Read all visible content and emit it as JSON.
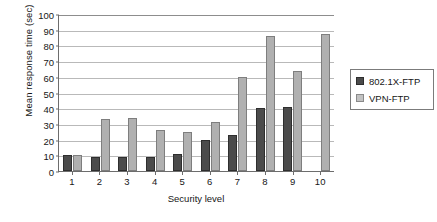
{
  "chart_data": {
    "type": "bar",
    "title": "",
    "xlabel": "Security level",
    "ylabel": "Mean response time (sec)",
    "categories": [
      "1",
      "2",
      "3",
      "4",
      "5",
      "6",
      "7",
      "8",
      "9",
      "10"
    ],
    "series": [
      {
        "name": "802.1X-FTP",
        "color": "#4b4b4b",
        "values": [
          10,
          9,
          9,
          9,
          11,
          20,
          23,
          40,
          41,
          0
        ]
      },
      {
        "name": "VPN-FTP",
        "color": "#b0b0b0",
        "values": [
          10,
          33,
          34,
          26,
          25,
          31,
          60,
          86,
          64,
          87
        ]
      }
    ],
    "ylim": [
      0,
      100
    ],
    "yticks": [
      0,
      10,
      20,
      30,
      40,
      50,
      60,
      70,
      80,
      90,
      100
    ],
    "ytick_labels": [
      "0",
      "10",
      "20",
      "30",
      "40",
      "50",
      "60",
      "70",
      "80",
      "90",
      "100"
    ],
    "grid": true,
    "legend_position": "right"
  }
}
